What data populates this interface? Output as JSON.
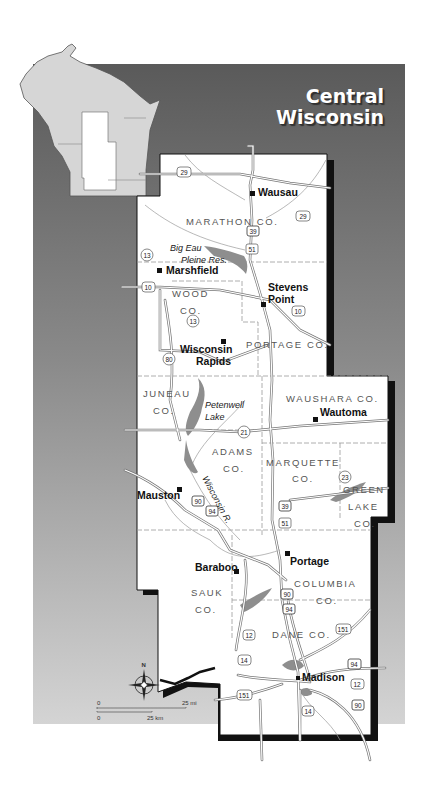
{
  "title": {
    "line1": "Central",
    "line2": "Wisconsin"
  },
  "counties": [
    {
      "id": "marathon",
      "label": "MARATHON CO."
    },
    {
      "id": "wood",
      "label1": "WOOD",
      "label2": "CO."
    },
    {
      "id": "portage",
      "label": "PORTAGE CO."
    },
    {
      "id": "juneau",
      "label1": "JUNEAU",
      "label2": "CO."
    },
    {
      "id": "waushara",
      "label": "WAUSHARA CO."
    },
    {
      "id": "adams",
      "label1": "ADAMS",
      "label2": "CO."
    },
    {
      "id": "marquette",
      "label1": "MARQUETTE",
      "label2": "CO."
    },
    {
      "id": "green-lake",
      "label1": "GREEN",
      "label2": "LAKE",
      "label3": "CO."
    },
    {
      "id": "sauk",
      "label1": "SAUK",
      "label2": "CO."
    },
    {
      "id": "columbia",
      "label1": "COLUMBIA",
      "label2": "CO."
    },
    {
      "id": "dane",
      "label": "DANE CO."
    }
  ],
  "cities": [
    {
      "id": "wausau",
      "label": "Wausau"
    },
    {
      "id": "marshfield",
      "label": "Marshfield"
    },
    {
      "id": "stevens-point",
      "label1": "Stevens",
      "label2": "Point"
    },
    {
      "id": "wisconsin-rapids",
      "label1": "Wisconsin",
      "label2": "Rapids"
    },
    {
      "id": "wautoma",
      "label": "Wautoma"
    },
    {
      "id": "mauston",
      "label": "Mauston"
    },
    {
      "id": "portage",
      "label": "Portage"
    },
    {
      "id": "baraboo",
      "label": "Baraboo"
    },
    {
      "id": "madison",
      "label": "Madison"
    }
  ],
  "water": [
    {
      "id": "big-eau-pleine",
      "label1": "Big Eau",
      "label2": "Pleine Res."
    },
    {
      "id": "petenwell",
      "label1": "Petenwell",
      "label2": "Lake"
    },
    {
      "id": "wisconsin-river",
      "label": "Wisconsin R."
    }
  ],
  "highways": {
    "h29a": "29",
    "h29b": "29",
    "h39a": "39",
    "h51a": "51",
    "h13a": "13",
    "h10a": "10",
    "h10b": "10",
    "h13b": "13",
    "h80": "80",
    "h21": "21",
    "h23": "23",
    "h90a": "90",
    "h94a": "94",
    "h39b": "39",
    "h51b": "51",
    "h90b": "90",
    "h94b": "94",
    "h12a": "12",
    "h151a": "151",
    "h14a": "14",
    "h94c": "94",
    "h12b": "12",
    "h151b": "151",
    "h14b": "14",
    "h90c": "90"
  },
  "compass": {
    "north": "N"
  },
  "scale": {
    "mi_zero": "0",
    "mi_label": "25 mi",
    "km_zero": "0",
    "km_label": "25 km"
  },
  "colors": {
    "background_top": "#5e5e5e",
    "background_bottom": "#d2d2d2",
    "state_fill": "#d6d6d6",
    "land": "#ffffff",
    "water": "#8e8e8e",
    "frame": "#111111"
  }
}
